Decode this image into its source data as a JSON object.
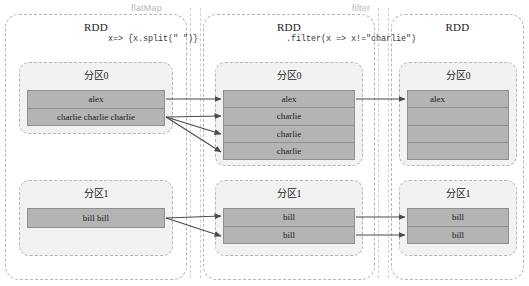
{
  "diagram": {
    "operations": [
      {
        "name": "flatMap",
        "label": "flatMap",
        "x": 131,
        "y": 3
      },
      {
        "name": "filter",
        "label": "filter",
        "x": 352,
        "y": 3
      }
    ],
    "expressions": [
      {
        "name": "flatmap-lambda",
        "text": "x=> {x.split(\" \")}",
        "x": 108,
        "y": 34
      },
      {
        "name": "filter-lambda",
        "text": ".filter(x => x!=\"charlie\")",
        "x": 286,
        "y": 34
      }
    ],
    "stages": [
      {
        "id": "source-rdd",
        "title": "RDD",
        "partitions": [
          {
            "title": "分区0",
            "rows": [
              "alex",
              "charlie  charlie  charlie"
            ]
          },
          {
            "title": "分区1",
            "rows": [
              "bill bill"
            ]
          }
        ]
      },
      {
        "id": "flatmap-rdd",
        "title": "RDD",
        "partitions": [
          {
            "title": "分区0",
            "rows": [
              "alex",
              "charlie",
              "charlie",
              "charlie"
            ]
          },
          {
            "title": "分区1",
            "rows": [
              "bill",
              "bill"
            ]
          }
        ]
      },
      {
        "id": "filter-rdd",
        "title": "RDD",
        "partitions": [
          {
            "title": "分区0",
            "rows": [
              "alex",
              "",
              "",
              ""
            ]
          },
          {
            "title": "分区1",
            "rows": [
              "bill",
              "bill"
            ]
          }
        ]
      }
    ],
    "colors": {
      "cell_fill": "#b4b4b4",
      "cell_border": "#8f8f8f",
      "partition_fill": "#f2f2f2",
      "dashed_border": "#b5b5b5",
      "arrow": "#4a4a4a",
      "op_label": "#b9b9b9",
      "background": "#ffffff"
    }
  }
}
